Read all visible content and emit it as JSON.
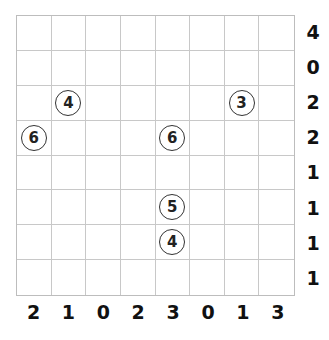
{
  "puzzle": {
    "rows": 8,
    "cols": 8,
    "row_clues": [
      "4",
      "0",
      "2",
      "2",
      "1",
      "1",
      "1",
      "1"
    ],
    "col_clues": [
      "2",
      "1",
      "0",
      "2",
      "3",
      "0",
      "1",
      "3"
    ],
    "circles": [
      {
        "row": 2,
        "col": 1,
        "value": "4"
      },
      {
        "row": 2,
        "col": 6,
        "value": "3"
      },
      {
        "row": 3,
        "col": 0,
        "value": "6"
      },
      {
        "row": 3,
        "col": 4,
        "value": "6"
      },
      {
        "row": 5,
        "col": 4,
        "value": "5"
      },
      {
        "row": 6,
        "col": 4,
        "value": "4"
      }
    ]
  }
}
